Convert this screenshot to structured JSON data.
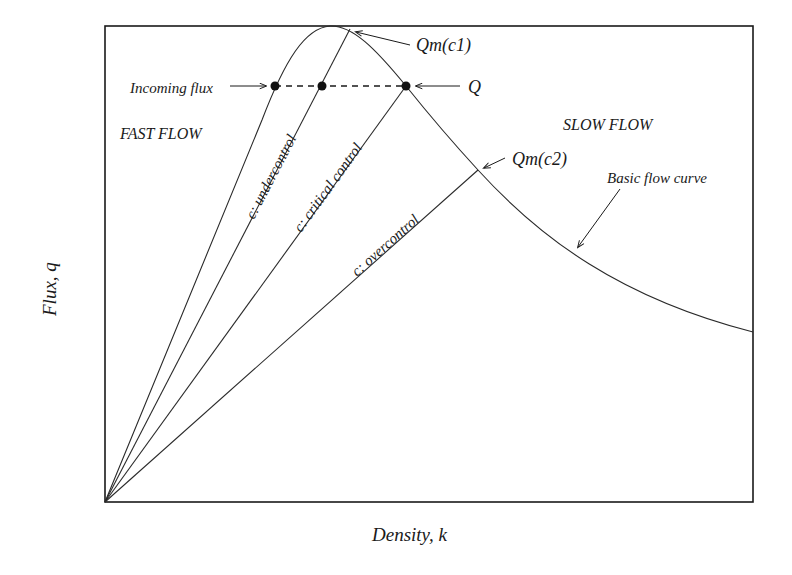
{
  "diagram": {
    "type": "traffic flow fundamental diagram",
    "axes": {
      "xlabel": "Density, k",
      "ylabel": "Flux, q"
    },
    "regions": {
      "left": "FAST FLOW",
      "right": "SLOW FLOW"
    },
    "curve": {
      "label": "Basic flow curve"
    },
    "control_lines": [
      {
        "id": "undercontrol",
        "label": "c: undercontrol"
      },
      {
        "id": "critical",
        "label": "c: critical control"
      },
      {
        "id": "overcontrol",
        "label": "c: overcontrol"
      }
    ],
    "annotations": {
      "qm_c1": "Qm(c1)",
      "qm_c2": "Qm(c2)",
      "incoming_flux": "Incoming flux",
      "q": "Q"
    },
    "colors": {
      "ink": "#1a1a1a",
      "background": "#ffffff"
    }
  }
}
